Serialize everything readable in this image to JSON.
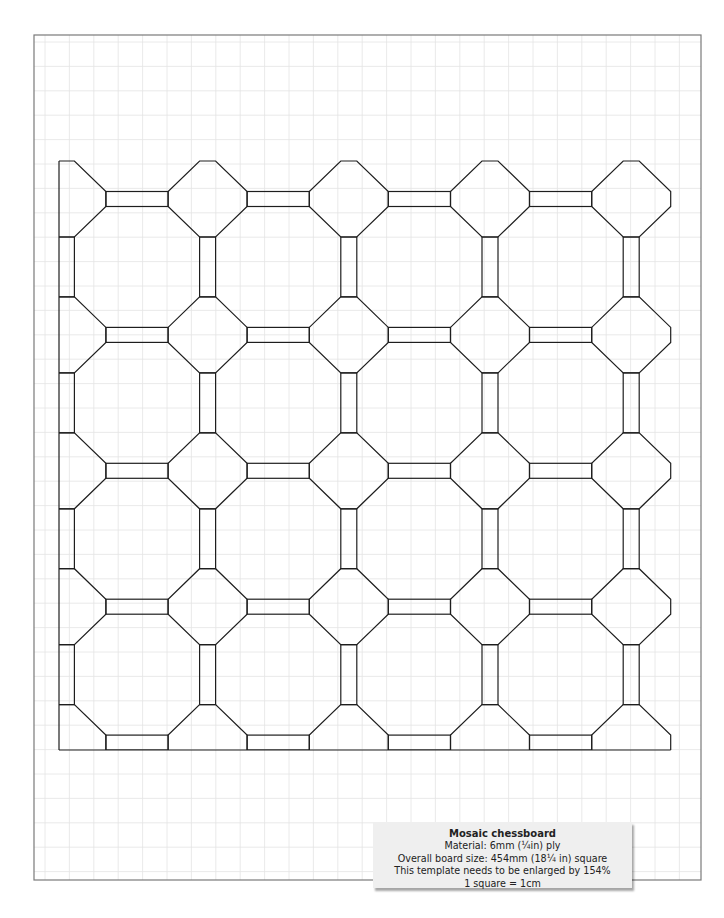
{
  "template": {
    "title": "Mosaic chessboard",
    "lines": [
      "Material:  6mm (¼in) ply",
      "Overall board size: 454mm (18¼ in) square",
      "This template needs to be enlarged by 154%",
      "1 square = 1cm"
    ]
  },
  "sheet": {
    "border": {
      "x": 34,
      "y": 35,
      "w": 667,
      "h": 845,
      "color": "#7a7a7a"
    },
    "grid": {
      "spacing": 24.4,
      "offset_x": 45,
      "offset_y": 42,
      "color": "#e4e4e4"
    }
  },
  "pattern": {
    "stroke": "#1e1e1e",
    "col_start": 66.4,
    "col_pitch": 141.2,
    "cols": 5,
    "row_start": 199,
    "row_pitch": 135.9,
    "rows": 5,
    "octagon": {
      "half_w": 39.5,
      "flat_w": 8,
      "half_h": 38,
      "flat_h": 7.5
    },
    "clip": {
      "left": 59,
      "top": 150,
      "right": 700,
      "bottom": 750
    }
  }
}
